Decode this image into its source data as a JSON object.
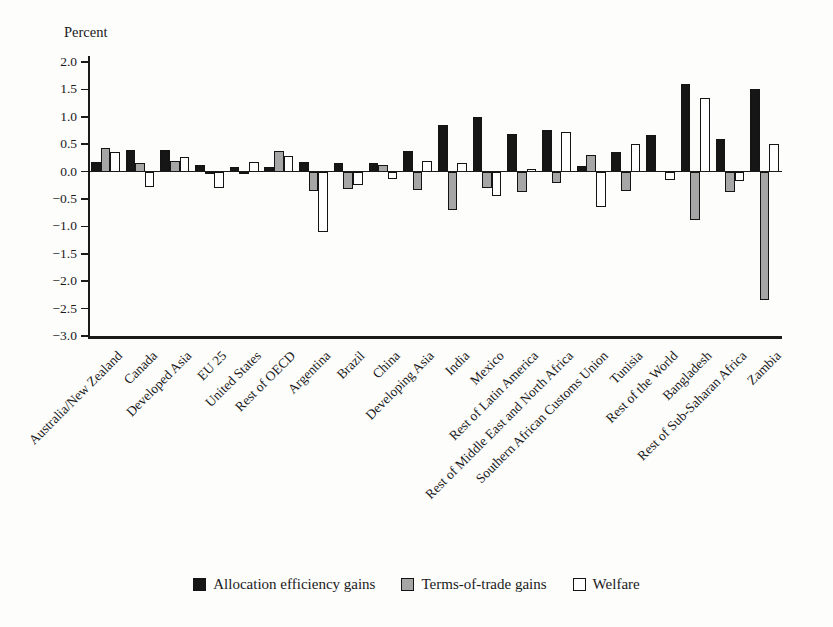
{
  "chart_data": {
    "type": "bar",
    "title": "",
    "ylabel": "Percent",
    "xlabel": "",
    "ylim": [
      -3.0,
      2.0
    ],
    "ytick_step": 0.5,
    "grid": false,
    "legend_position": "bottom",
    "categories": [
      "Australia/New Zealand",
      "Canada",
      "Developed Asia",
      "EU 25",
      "United States",
      "Rest of OECD",
      "Argentina",
      "Brazil",
      "China",
      "Developing Asia",
      "India",
      "Mexico",
      "Rest of Latin America",
      "Rest of Middle East and North Africa",
      "Southern African Customs Union",
      "Tunisia",
      "Rest of the World",
      "Bangladesh",
      "Rest of Sub-Saharan Africa",
      "Zambia"
    ],
    "series": [
      {
        "name": "Allocation efficiency gains",
        "color": "#161616",
        "values": [
          0.18,
          0.4,
          0.4,
          0.12,
          0.08,
          0.08,
          0.18,
          0.15,
          0.15,
          0.38,
          0.85,
          1.0,
          0.68,
          0.76,
          0.1,
          0.35,
          0.67,
          1.6,
          0.6,
          1.5
        ]
      },
      {
        "name": "Terms-of-trade gains",
        "color": "#a6a6a6",
        "values": [
          0.43,
          0.15,
          0.2,
          -0.05,
          -0.05,
          0.37,
          -0.35,
          -0.32,
          0.12,
          -0.33,
          -0.7,
          -0.3,
          -0.37,
          -0.2,
          0.3,
          -0.35,
          0.0,
          -0.88,
          -0.38,
          -2.35
        ]
      },
      {
        "name": "Welfare",
        "color": "#ffffff",
        "values": [
          0.35,
          -0.28,
          0.26,
          -0.3,
          0.18,
          0.28,
          -1.1,
          -0.25,
          -0.13,
          0.2,
          0.15,
          -0.45,
          0.05,
          0.72,
          -0.65,
          0.5,
          -0.15,
          1.35,
          -0.18,
          0.5
        ]
      }
    ]
  }
}
